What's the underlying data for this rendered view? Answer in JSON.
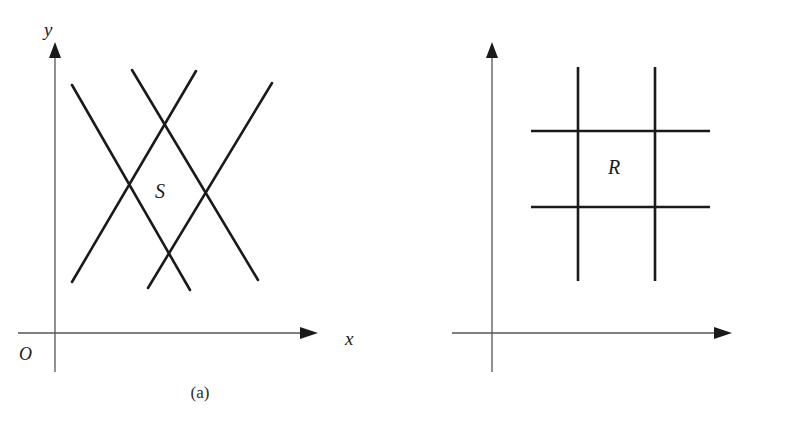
{
  "figure": {
    "line_color": "#1a1a1a",
    "axis_color": "#555555",
    "background": "#ffffff"
  },
  "panel_a": {
    "caption": "(a)",
    "axis_x_label": "x",
    "axis_y_label": "y",
    "origin_label": "O",
    "region_label": "S",
    "region_description": "parallelogram bounded by four straight lines"
  },
  "panel_b": {
    "caption": "(b)",
    "axis_u_label": "u",
    "axis_v_label": "v",
    "origin_label": "O",
    "region_label": "R",
    "region_description": "rectangle bounded by two vertical and two horizontal lines"
  },
  "chart_data": {
    "type": "diagram",
    "panels": [
      {
        "name": "a",
        "caption": "(a)",
        "xlabel": "x",
        "ylabel": "y",
        "origin": "O",
        "region": "S",
        "axes": {
          "x_axis": {
            "x1": 18,
            "y1": 333,
            "x2": 308,
            "y2": 333,
            "arrow": "right"
          },
          "y_axis": {
            "x1": 55,
            "y1": 370,
            "x2": 55,
            "y2": 50,
            "arrow": "up"
          }
        },
        "lines": [
          {
            "name": "descending-left",
            "x1": 72,
            "y1": 85,
            "x2": 190,
            "y2": 290
          },
          {
            "name": "descending-right",
            "x1": 132,
            "y1": 70,
            "x2": 258,
            "y2": 280
          },
          {
            "name": "ascending-left",
            "x1": 72,
            "y1": 282,
            "x2": 196,
            "y2": 71
          },
          {
            "name": "ascending-right",
            "x1": 148,
            "y1": 288,
            "x2": 272,
            "y2": 83
          }
        ],
        "region_label_pos": {
          "x": 162,
          "y": 192
        }
      },
      {
        "name": "b",
        "caption": "(b)",
        "xlabel": "u",
        "ylabel": "v",
        "origin": "O",
        "region": "R",
        "axes": {
          "u_axis": {
            "x1": 452,
            "y1": 333,
            "x2": 722,
            "y2": 333,
            "arrow": "right"
          },
          "v_axis": {
            "x1": 492,
            "y1": 370,
            "x2": 492,
            "y2": 50,
            "arrow": "up"
          }
        },
        "lines": [
          {
            "name": "vertical-left",
            "x1": 578,
            "y1": 67,
            "x2": 578,
            "y2": 281
          },
          {
            "name": "vertical-right",
            "x1": 655,
            "y1": 67,
            "x2": 655,
            "y2": 281
          },
          {
            "name": "horizontal-top",
            "x1": 531,
            "y1": 131,
            "x2": 710,
            "y2": 131
          },
          {
            "name": "horizontal-bottom",
            "x1": 531,
            "y1": 207,
            "x2": 710,
            "y2": 207
          }
        ],
        "region_label_pos": {
          "x": 615,
          "y": 168
        }
      }
    ]
  }
}
